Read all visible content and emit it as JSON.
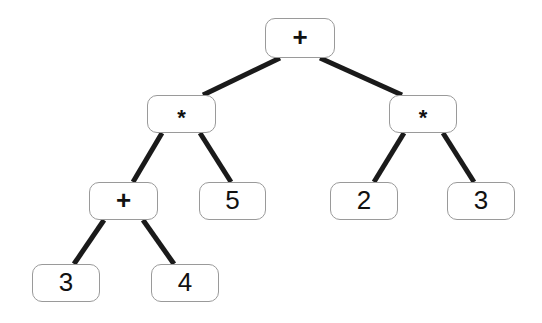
{
  "diagram": {
    "type": "binary-expression-tree",
    "background_color": "#ffffff",
    "node_border_color": "#9a9a9a",
    "node_fill_color": "#ffffff",
    "edge_color": "#1a1a1a",
    "text_color": "#111111",
    "edge_width": 5,
    "nodes": [
      {
        "id": "root",
        "label": "+",
        "kind": "operator",
        "level": 0,
        "x": 265,
        "y": 18,
        "w": 70,
        "h": 40
      },
      {
        "id": "mul-left",
        "label": "*",
        "kind": "operator",
        "level": 1,
        "x": 147,
        "y": 95,
        "w": 69,
        "h": 38
      },
      {
        "id": "mul-right",
        "label": "*",
        "kind": "operator",
        "level": 1,
        "x": 389,
        "y": 95,
        "w": 68,
        "h": 38
      },
      {
        "id": "plus-inner",
        "label": "+",
        "kind": "operator",
        "level": 2,
        "x": 89,
        "y": 182,
        "w": 69,
        "h": 38
      },
      {
        "id": "num-5",
        "label": "5",
        "kind": "number",
        "level": 2,
        "x": 199,
        "y": 182,
        "w": 67,
        "h": 38
      },
      {
        "id": "num-2",
        "label": "2",
        "kind": "number",
        "level": 2,
        "x": 330,
        "y": 182,
        "w": 68,
        "h": 38
      },
      {
        "id": "num-3-right",
        "label": "3",
        "kind": "number",
        "level": 2,
        "x": 447,
        "y": 182,
        "w": 68,
        "h": 38
      },
      {
        "id": "num-3-left",
        "label": "3",
        "kind": "number",
        "level": 3,
        "x": 32,
        "y": 264,
        "w": 68,
        "h": 38
      },
      {
        "id": "num-4",
        "label": "4",
        "kind": "number",
        "level": 3,
        "x": 151,
        "y": 264,
        "w": 68,
        "h": 38
      }
    ],
    "edges": [
      {
        "from": "root",
        "to": "mul-left",
        "x1": 280,
        "y1": 58,
        "x2": 203,
        "y2": 95
      },
      {
        "from": "root",
        "to": "mul-right",
        "x1": 320,
        "y1": 58,
        "x2": 402,
        "y2": 95
      },
      {
        "from": "mul-left",
        "to": "plus-inner",
        "x1": 162,
        "y1": 133,
        "x2": 133,
        "y2": 182
      },
      {
        "from": "mul-left",
        "to": "num-5",
        "x1": 200,
        "y1": 133,
        "x2": 231,
        "y2": 182
      },
      {
        "from": "mul-right",
        "to": "num-2",
        "x1": 404,
        "y1": 133,
        "x2": 374,
        "y2": 182
      },
      {
        "from": "mul-right",
        "to": "num-3-right",
        "x1": 443,
        "y1": 133,
        "x2": 474,
        "y2": 182
      },
      {
        "from": "plus-inner",
        "to": "num-3-left",
        "x1": 104,
        "y1": 220,
        "x2": 74,
        "y2": 264
      },
      {
        "from": "plus-inner",
        "to": "num-4",
        "x1": 143,
        "y1": 220,
        "x2": 174,
        "y2": 264
      }
    ]
  }
}
